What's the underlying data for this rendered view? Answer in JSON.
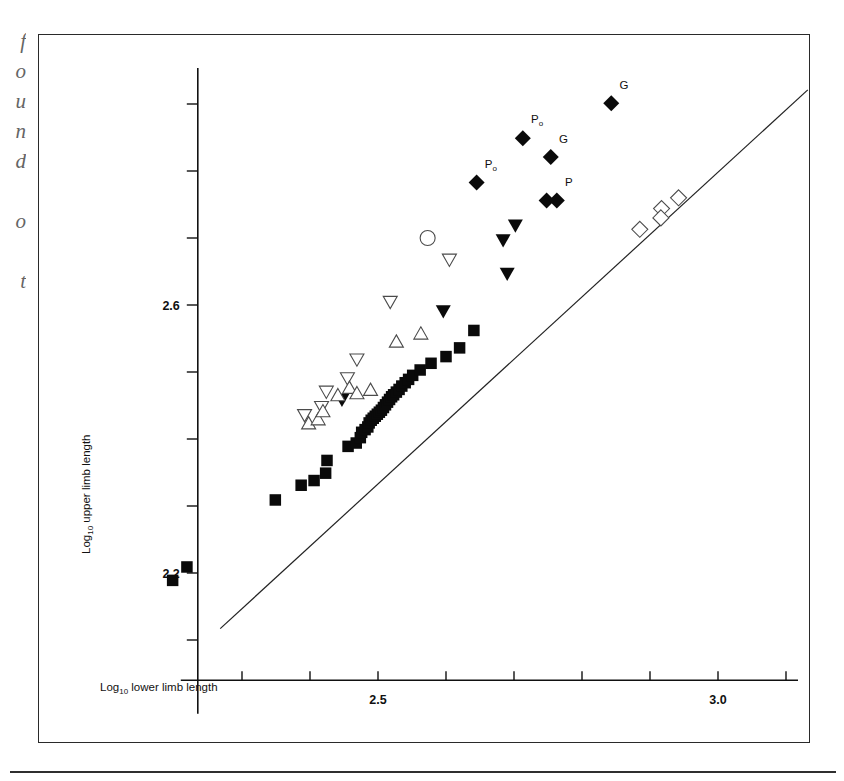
{
  "page": {
    "margin_text": "f\no\nu\nn\nd\n\no\n\nt"
  },
  "axes": {
    "x_title_main": "Log",
    "x_title_sub": "10",
    "x_title_rest": " lower limb length",
    "y_title_main": "Log",
    "y_title_sub": "10",
    "y_title_rest": " upper limb length",
    "x_ticks": [
      {
        "value": 2.3,
        "label": ""
      },
      {
        "value": 2.4,
        "label": ""
      },
      {
        "value": 2.5,
        "label": "2.5"
      },
      {
        "value": 2.6,
        "label": ""
      },
      {
        "value": 2.7,
        "label": ""
      },
      {
        "value": 2.8,
        "label": ""
      },
      {
        "value": 2.9,
        "label": ""
      },
      {
        "value": 3.0,
        "label": "3.0"
      },
      {
        "value": 3.1,
        "label": ""
      }
    ],
    "y_ticks": [
      {
        "value": 2.1,
        "label": ""
      },
      {
        "value": 2.2,
        "label": "2.2"
      },
      {
        "value": 2.3,
        "label": ""
      },
      {
        "value": 2.4,
        "label": ""
      },
      {
        "value": 2.5,
        "label": ""
      },
      {
        "value": 2.6,
        "label": "2.6"
      },
      {
        "value": 2.7,
        "label": ""
      },
      {
        "value": 2.8,
        "label": ""
      },
      {
        "value": 2.9,
        "label": ""
      }
    ]
  },
  "chart_data": {
    "type": "scatter",
    "title": "",
    "xlabel": "Log10 lower limb length",
    "ylabel": "Log10 upper limb length",
    "xlim": [
      2.24,
      3.13
    ],
    "ylim": [
      2.05,
      2.96
    ],
    "grid": false,
    "legend": "none",
    "fit_line": {
      "x": [
        2.268,
        3.132
      ],
      "y": [
        2.117,
        2.921
      ]
    },
    "series": [
      {
        "name": "filled-square",
        "marker": "filled-square",
        "points": [
          [
            2.198,
            2.189
          ],
          [
            2.219,
            2.209
          ],
          [
            2.349,
            2.309
          ],
          [
            2.387,
            2.331
          ],
          [
            2.406,
            2.338
          ],
          [
            2.423,
            2.349
          ],
          [
            2.425,
            2.368
          ],
          [
            2.456,
            2.389
          ],
          [
            2.468,
            2.394
          ],
          [
            2.474,
            2.402
          ],
          [
            2.476,
            2.41
          ],
          [
            2.481,
            2.414
          ],
          [
            2.485,
            2.418
          ],
          [
            2.487,
            2.424
          ],
          [
            2.49,
            2.428
          ],
          [
            2.493,
            2.431
          ],
          [
            2.496,
            2.434
          ],
          [
            2.499,
            2.437
          ],
          [
            2.502,
            2.44
          ],
          [
            2.505,
            2.443
          ],
          [
            2.508,
            2.447
          ],
          [
            2.511,
            2.451
          ],
          [
            2.514,
            2.455
          ],
          [
            2.517,
            2.459
          ],
          [
            2.52,
            2.463
          ],
          [
            2.523,
            2.466
          ],
          [
            2.527,
            2.47
          ],
          [
            2.531,
            2.474
          ],
          [
            2.535,
            2.479
          ],
          [
            2.54,
            2.484
          ],
          [
            2.545,
            2.489
          ],
          [
            2.551,
            2.495
          ],
          [
            2.562,
            2.503
          ],
          [
            2.578,
            2.513
          ],
          [
            2.6,
            2.523
          ],
          [
            2.62,
            2.536
          ],
          [
            2.641,
            2.562
          ]
        ]
      },
      {
        "name": "filled-down-triangle",
        "marker": "filled-down-triangle",
        "points": [
          [
            2.447,
            2.458
          ],
          [
            2.596,
            2.59
          ],
          [
            2.69,
            2.646
          ],
          [
            2.684,
            2.696
          ],
          [
            2.702,
            2.718
          ]
        ]
      },
      {
        "name": "open-down-triangle",
        "marker": "open-down-triangle",
        "points": [
          [
            2.392,
            2.435
          ],
          [
            2.417,
            2.447
          ],
          [
            2.424,
            2.47
          ],
          [
            2.455,
            2.49
          ],
          [
            2.469,
            2.518
          ],
          [
            2.518,
            2.604
          ],
          [
            2.605,
            2.667
          ]
        ]
      },
      {
        "name": "open-up-triangle",
        "marker": "open-up-triangle",
        "points": [
          [
            2.398,
            2.424
          ],
          [
            2.412,
            2.43
          ],
          [
            2.419,
            2.442
          ],
          [
            2.441,
            2.466
          ],
          [
            2.458,
            2.477
          ],
          [
            2.469,
            2.469
          ],
          [
            2.489,
            2.474
          ],
          [
            2.527,
            2.546
          ],
          [
            2.563,
            2.558
          ]
        ]
      },
      {
        "name": "open-circle",
        "marker": "open-circle",
        "points": [
          [
            2.573,
            2.7
          ]
        ]
      },
      {
        "name": "open-diamond",
        "marker": "open-diamond",
        "points": [
          [
            2.885,
            2.713
          ],
          [
            2.917,
            2.744
          ],
          [
            2.916,
            2.73
          ],
          [
            2.942,
            2.76
          ]
        ]
      },
      {
        "name": "filled-diamond-labeled",
        "marker": "filled-diamond",
        "points": [
          [
            2.645,
            2.783
          ],
          [
            2.713,
            2.849
          ],
          [
            2.754,
            2.821
          ],
          [
            2.748,
            2.756
          ],
          [
            2.763,
            2.756
          ],
          [
            2.843,
            2.901
          ]
        ],
        "labels": [
          "P0",
          "P0",
          "G",
          "",
          "P",
          "G"
        ]
      }
    ],
    "annotations": [
      {
        "text": "P",
        "sub": "o",
        "x": 2.657,
        "y": 2.805
      },
      {
        "text": "P",
        "sub": "o",
        "x": 2.725,
        "y": 2.871
      },
      {
        "text": "G",
        "sub": "",
        "x": 2.766,
        "y": 2.842
      },
      {
        "text": "P",
        "sub": "",
        "x": 2.775,
        "y": 2.778
      },
      {
        "text": "G",
        "sub": "",
        "x": 2.855,
        "y": 2.923
      }
    ]
  }
}
